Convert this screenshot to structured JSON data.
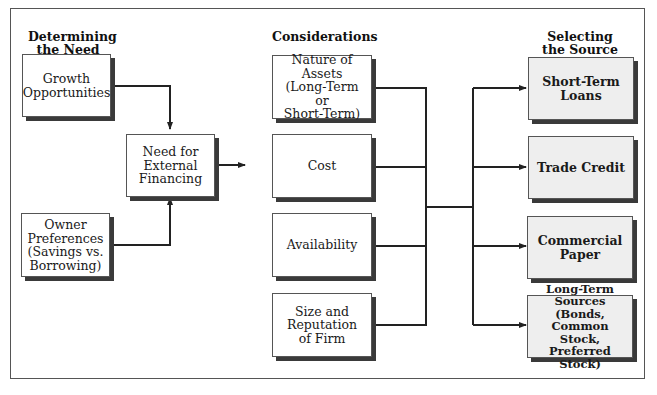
{
  "headings": {
    "need": "Determining\nthe Need",
    "considerations": "Considerations",
    "source": "Selecting\nthe Source"
  },
  "need_boxes": [
    {
      "label": "Growth\nOpportunities"
    },
    {
      "label": "Owner\nPreferences\n(Savings vs.\nBorrowing)"
    }
  ],
  "center_box": {
    "label": "Need for\nExternal\nFinancing"
  },
  "consideration_boxes": [
    {
      "label": "Nature of Assets\n(Long-Term\nor\nShort-Term)"
    },
    {
      "label": "Cost"
    },
    {
      "label": "Availability"
    },
    {
      "label": "Size and\nReputation\nof Firm"
    }
  ],
  "source_boxes": [
    {
      "label": "Short-Term\nLoans"
    },
    {
      "label": "Trade Credit"
    },
    {
      "label": "Commercial\nPaper"
    },
    {
      "label": "Long-Term Sources\n(Bonds, Common\nStock, Preferred\nStock)"
    }
  ],
  "colors": {
    "line": "#222222",
    "shadow": "#3a3a3a",
    "source_fill": "#eeeeee"
  }
}
